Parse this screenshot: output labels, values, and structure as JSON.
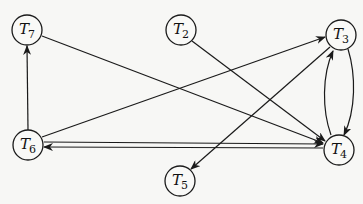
{
  "diagram": {
    "type": "directed-graph",
    "nodes": [
      {
        "id": "T7",
        "main": "T",
        "sub": "7",
        "x": 27,
        "y": 30
      },
      {
        "id": "T2",
        "main": "T",
        "sub": "2",
        "x": 181,
        "y": 30
      },
      {
        "id": "T3",
        "main": "T",
        "sub": "3",
        "x": 341,
        "y": 35
      },
      {
        "id": "T6",
        "main": "T",
        "sub": "6",
        "x": 28,
        "y": 145
      },
      {
        "id": "T4",
        "main": "T",
        "sub": "4",
        "x": 339,
        "y": 150
      },
      {
        "id": "T5",
        "main": "T",
        "sub": "5",
        "x": 180,
        "y": 181
      }
    ],
    "edges": [
      {
        "from": "T6",
        "to": "T7"
      },
      {
        "from": "T7",
        "to": "T4"
      },
      {
        "from": "T2",
        "to": "T4"
      },
      {
        "from": "T6",
        "to": "T3"
      },
      {
        "from": "T3",
        "to": "T5"
      },
      {
        "from": "T6",
        "to": "T4"
      },
      {
        "from": "T4",
        "to": "T6"
      },
      {
        "from": "T3",
        "to": "T4"
      },
      {
        "from": "T4",
        "to": "T3"
      }
    ],
    "colors": {
      "stroke": "#1a1a1a",
      "background": "#f7f7f5"
    }
  }
}
